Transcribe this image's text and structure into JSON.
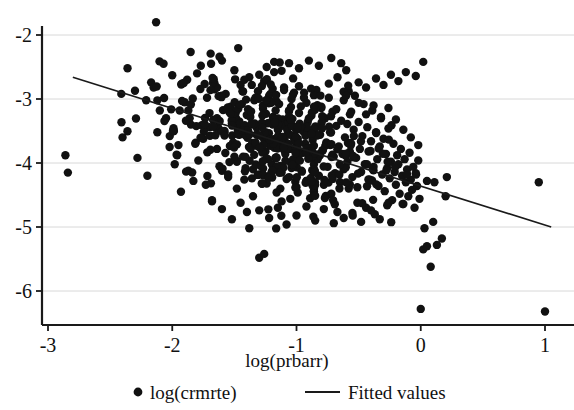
{
  "chart_data": {
    "type": "scatter",
    "title": "",
    "subtitle": "",
    "xlabel": "log(prbarr)",
    "ylabel": "",
    "xlim": [
      -3.15,
      1.15
    ],
    "ylim": [
      -6.55,
      -1.62
    ],
    "xticks": [
      -3,
      -2,
      -1,
      0,
      1
    ],
    "xtick_labels": [
      "-3",
      "-2",
      "-1",
      "0",
      "1"
    ],
    "yticks": [
      -2,
      -3,
      -4,
      -5,
      -6
    ],
    "ytick_labels": [
      "-2",
      "-3",
      "-4",
      "-5",
      "-6"
    ],
    "grid": "horizontal",
    "legend_position": "bottom",
    "legend": [
      {
        "key": "scatter",
        "marker": "circle",
        "label": "log(crmrte)"
      },
      {
        "key": "fit",
        "marker": "line",
        "label": "Fitted values"
      }
    ],
    "series": [
      {
        "name": "log(crmrte)",
        "type": "scatter",
        "marker": "filled-circle",
        "color": "#111111",
        "marker_size": 5.2,
        "n_points": 286,
        "points": [
          [
            -2.13,
            -1.8
          ],
          [
            -2.86,
            -3.88
          ],
          [
            -2.84,
            -4.15
          ],
          [
            -2.41,
            -2.92
          ],
          [
            -2.36,
            -2.52
          ],
          [
            -2.3,
            -2.87
          ],
          [
            -2.21,
            -3.02
          ],
          [
            -2.17,
            -2.74
          ],
          [
            -2.15,
            -2.82
          ],
          [
            -2.1,
            -3.18
          ],
          [
            -2.07,
            -2.45
          ],
          [
            -2.05,
            -3.3
          ],
          [
            -2.02,
            -3.58
          ],
          [
            -2.0,
            -2.63
          ],
          [
            -1.98,
            -4.02
          ],
          [
            -1.96,
            -3.88
          ],
          [
            -1.95,
            -3.72
          ],
          [
            -1.93,
            -4.45
          ],
          [
            -1.9,
            -3.05
          ],
          [
            -1.88,
            -2.7
          ],
          [
            -1.87,
            -4.12
          ],
          [
            -1.85,
            -3.4
          ],
          [
            -1.83,
            -4.28
          ],
          [
            -1.8,
            -2.6
          ],
          [
            -1.79,
            -3.96
          ],
          [
            -1.77,
            -2.48
          ],
          [
            -1.75,
            -3.62
          ],
          [
            -1.73,
            -4.34
          ],
          [
            -1.72,
            -2.98
          ],
          [
            -1.7,
            -3.22
          ],
          [
            -1.68,
            -4.6
          ],
          [
            -1.66,
            -2.85
          ],
          [
            -1.64,
            -3.78
          ],
          [
            -1.62,
            -4.05
          ],
          [
            -1.6,
            -2.4
          ],
          [
            -1.58,
            -3.52
          ],
          [
            -1.57,
            -2.92
          ],
          [
            -1.55,
            -4.22
          ],
          [
            -1.53,
            -3.12
          ],
          [
            -1.51,
            -3.68
          ],
          [
            -1.5,
            -2.55
          ],
          [
            -1.48,
            -4.4
          ],
          [
            -1.46,
            -3.35
          ],
          [
            -1.45,
            -2.78
          ],
          [
            -1.43,
            -3.9
          ],
          [
            -1.41,
            -4.08
          ],
          [
            -1.4,
            -3.25
          ],
          [
            -1.38,
            -2.66
          ],
          [
            -1.37,
            -3.74
          ],
          [
            -1.35,
            -4.52
          ],
          [
            -1.34,
            -3.02
          ],
          [
            -1.32,
            -3.45
          ],
          [
            -1.31,
            -2.88
          ],
          [
            -1.3,
            -4.18
          ],
          [
            -1.28,
            -3.58
          ],
          [
            -1.27,
            -3.15
          ],
          [
            -1.26,
            -2.72
          ],
          [
            -1.25,
            -3.82
          ],
          [
            -1.24,
            -4.32
          ],
          [
            -1.23,
            -3.38
          ],
          [
            -1.22,
            -2.95
          ],
          [
            -1.21,
            -3.66
          ],
          [
            -1.2,
            -4.02
          ],
          [
            -1.19,
            -3.28
          ],
          [
            -1.18,
            -2.58
          ],
          [
            -1.17,
            -3.92
          ],
          [
            -1.16,
            -4.46
          ],
          [
            -1.15,
            -3.48
          ],
          [
            -1.14,
            -3.08
          ],
          [
            -1.13,
            -3.72
          ],
          [
            -1.12,
            -4.15
          ],
          [
            -1.11,
            -3.32
          ],
          [
            -1.1,
            -2.82
          ],
          [
            -1.09,
            -3.86
          ],
          [
            -1.08,
            -4.25
          ],
          [
            -1.07,
            -3.55
          ],
          [
            -1.06,
            -3.18
          ],
          [
            -1.05,
            -3.78
          ],
          [
            -1.04,
            -4.08
          ],
          [
            -1.03,
            -3.42
          ],
          [
            -1.02,
            -2.9
          ],
          [
            -1.01,
            -3.96
          ],
          [
            -1.0,
            -4.38
          ],
          [
            -0.99,
            -3.62
          ],
          [
            -0.98,
            -3.22
          ],
          [
            -0.97,
            -3.84
          ],
          [
            -0.96,
            -4.12
          ],
          [
            -0.95,
            -3.5
          ],
          [
            -0.94,
            -2.98
          ],
          [
            -0.93,
            -3.7
          ],
          [
            -0.92,
            -4.28
          ],
          [
            -0.91,
            -3.36
          ],
          [
            -0.9,
            -3.88
          ],
          [
            -0.89,
            -4.55
          ],
          [
            -0.88,
            -3.26
          ],
          [
            -0.87,
            -3.64
          ],
          [
            -0.86,
            -4.02
          ],
          [
            -0.85,
            -3.44
          ],
          [
            -0.84,
            -2.86
          ],
          [
            -0.83,
            -3.94
          ],
          [
            -0.82,
            -4.2
          ],
          [
            -0.81,
            -3.56
          ],
          [
            -0.8,
            -3.14
          ],
          [
            -0.79,
            -3.8
          ],
          [
            -0.78,
            -4.34
          ],
          [
            -0.77,
            -3.3
          ],
          [
            -0.76,
            -3.68
          ],
          [
            -0.75,
            -4.06
          ],
          [
            -0.74,
            -2.76
          ],
          [
            -0.73,
            -3.52
          ],
          [
            -0.72,
            -4.48
          ],
          [
            -0.71,
            -3.2
          ],
          [
            -0.7,
            -3.9
          ],
          [
            -0.69,
            -4.16
          ],
          [
            -0.68,
            -3.42
          ],
          [
            -0.67,
            -2.66
          ],
          [
            -0.66,
            -3.74
          ],
          [
            -0.65,
            -4.3
          ],
          [
            -0.64,
            -3.34
          ],
          [
            -0.63,
            -3.86
          ],
          [
            -0.62,
            -4.1
          ],
          [
            -0.61,
            -3.6
          ],
          [
            -0.6,
            -2.55
          ],
          [
            -0.59,
            -3.98
          ],
          [
            -0.58,
            -4.4
          ],
          [
            -0.57,
            -3.24
          ],
          [
            -0.56,
            -3.7
          ],
          [
            -0.55,
            -4.22
          ],
          [
            -0.54,
            -3.48
          ],
          [
            -0.53,
            -2.95
          ],
          [
            -0.52,
            -3.92
          ],
          [
            -0.51,
            -4.62
          ],
          [
            -0.5,
            -3.36
          ],
          [
            -0.49,
            -3.78
          ],
          [
            -0.48,
            -4.14
          ],
          [
            -0.47,
            -3.58
          ],
          [
            -0.46,
            -3.08
          ],
          [
            -0.45,
            -4.02
          ],
          [
            -0.44,
            -4.7
          ],
          [
            -0.43,
            -3.44
          ],
          [
            -0.42,
            -3.82
          ],
          [
            -0.41,
            -4.26
          ],
          [
            -0.4,
            -3.66
          ],
          [
            -0.39,
            -3.18
          ],
          [
            -0.38,
            -4.06
          ],
          [
            -0.37,
            -4.8
          ],
          [
            -0.36,
            -3.52
          ],
          [
            -0.35,
            -3.94
          ],
          [
            -0.34,
            -4.36
          ],
          [
            -0.33,
            -3.74
          ],
          [
            -0.32,
            -3.3
          ],
          [
            -0.31,
            -4.18
          ],
          [
            -0.3,
            -3.62
          ],
          [
            -0.29,
            -4.44
          ],
          [
            -0.28,
            -3.86
          ],
          [
            -0.27,
            -4.08
          ],
          [
            -0.26,
            -3.46
          ],
          [
            -0.25,
            -4.24
          ],
          [
            -0.24,
            -3.98
          ],
          [
            -0.23,
            -4.58
          ],
          [
            -0.22,
            -3.7
          ],
          [
            -0.21,
            -4.14
          ],
          [
            -0.2,
            -4.34
          ],
          [
            -0.19,
            -3.88
          ],
          [
            -0.18,
            -4.02
          ],
          [
            -0.17,
            -4.48
          ],
          [
            -0.16,
            -3.78
          ],
          [
            -0.15,
            -4.2
          ],
          [
            -0.14,
            -4.64
          ],
          [
            -0.13,
            -3.94
          ],
          [
            -0.12,
            -4.3
          ],
          [
            -0.11,
            -4.1
          ],
          [
            -0.1,
            -4.52
          ],
          [
            -0.09,
            -3.84
          ],
          [
            -0.08,
            -4.26
          ],
          [
            -0.07,
            -4.42
          ],
          [
            -0.06,
            -4.06
          ],
          [
            -0.05,
            -4.7
          ],
          [
            -0.04,
            -4.16
          ],
          [
            -0.03,
            -4.36
          ],
          [
            -0.02,
            -3.96
          ],
          [
            -0.01,
            -4.56
          ],
          [
            0.0,
            -6.28
          ],
          [
            0.02,
            -5.35
          ],
          [
            0.03,
            -5.02
          ],
          [
            0.05,
            -5.3
          ],
          [
            0.08,
            -5.62
          ],
          [
            0.1,
            -4.92
          ],
          [
            0.13,
            -5.28
          ],
          [
            0.17,
            -5.18
          ],
          [
            0.2,
            -4.52
          ],
          [
            0.21,
            -4.22
          ],
          [
            0.05,
            -4.28
          ],
          [
            0.11,
            -4.3
          ],
          [
            1.0,
            -6.32
          ],
          [
            0.95,
            -4.3
          ],
          [
            -0.62,
            -4.86
          ],
          [
            -0.55,
            -4.78
          ],
          [
            -0.48,
            -4.92
          ],
          [
            -0.4,
            -4.74
          ],
          [
            -0.33,
            -4.88
          ],
          [
            -0.27,
            -4.66
          ],
          [
            -0.7,
            -4.94
          ],
          [
            -0.78,
            -4.72
          ],
          [
            -0.85,
            -4.9
          ],
          [
            -0.92,
            -4.68
          ],
          [
            -1.0,
            -4.82
          ],
          [
            -1.08,
            -4.96
          ],
          [
            -1.15,
            -4.7
          ],
          [
            -1.22,
            -4.86
          ],
          [
            -1.3,
            -4.74
          ],
          [
            -1.38,
            -5.02
          ],
          [
            -1.45,
            -4.62
          ],
          [
            -1.52,
            -4.88
          ],
          [
            -1.6,
            -4.72
          ],
          [
            -1.68,
            -4.58
          ],
          [
            -1.3,
            -5.48
          ],
          [
            -1.26,
            -5.42
          ],
          [
            -1.12,
            -4.6
          ],
          [
            -1.05,
            -4.56
          ],
          [
            -2.4,
            -3.6
          ],
          [
            -2.28,
            -3.92
          ],
          [
            -2.2,
            -4.2
          ],
          [
            -2.12,
            -3.52
          ],
          [
            -1.6,
            -4.12
          ],
          [
            -1.55,
            -4.18
          ],
          [
            -1.48,
            -3.98
          ],
          [
            -1.42,
            -4.26
          ],
          [
            -1.35,
            -4.1
          ],
          [
            -1.28,
            -4.32
          ],
          [
            -1.2,
            -4.14
          ],
          [
            -1.13,
            -4.4
          ],
          [
            -1.06,
            -4.22
          ],
          [
            -0.99,
            -4.46
          ],
          [
            -0.92,
            -4.28
          ],
          [
            -0.86,
            -4.5
          ],
          [
            -1.5,
            -3.2
          ],
          [
            -1.44,
            -3.08
          ],
          [
            -1.39,
            -3.16
          ],
          [
            -1.33,
            -2.98
          ],
          [
            -1.27,
            -3.1
          ],
          [
            -1.21,
            -2.92
          ],
          [
            -1.16,
            -3.04
          ],
          [
            -1.1,
            -2.86
          ],
          [
            -1.04,
            -3.0
          ],
          [
            -0.98,
            -2.8
          ],
          [
            -1.7,
            -3.44
          ],
          [
            -1.64,
            -3.3
          ],
          [
            -1.58,
            -3.5
          ],
          [
            -1.52,
            -3.38
          ],
          [
            -1.46,
            -3.56
          ],
          [
            -1.4,
            -3.46
          ],
          [
            -0.92,
            -3.06
          ],
          [
            -0.86,
            -2.94
          ],
          [
            -0.8,
            -3.12
          ],
          [
            -0.74,
            -2.98
          ],
          [
            -0.68,
            -3.16
          ],
          [
            -0.62,
            -3.02
          ],
          [
            -0.56,
            -3.2
          ],
          [
            -0.5,
            -3.06
          ],
          [
            -0.44,
            -3.24
          ],
          [
            -0.38,
            -3.1
          ],
          [
            -0.32,
            -3.28
          ],
          [
            -0.26,
            -3.14
          ],
          [
            -0.2,
            -3.32
          ],
          [
            -0.14,
            -3.48
          ],
          [
            -0.08,
            -3.6
          ],
          [
            -0.02,
            -3.72
          ],
          [
            -0.58,
            -2.88
          ],
          [
            -0.5,
            -2.74
          ],
          [
            -0.44,
            -2.82
          ],
          [
            -0.36,
            -2.68
          ],
          [
            -0.3,
            -2.78
          ],
          [
            -0.24,
            -2.62
          ],
          [
            -0.18,
            -2.72
          ],
          [
            -0.12,
            -2.58
          ],
          [
            -1.3,
            -2.62
          ],
          [
            -1.24,
            -2.5
          ],
          [
            -1.18,
            -2.42
          ],
          [
            -1.12,
            -2.56
          ],
          [
            -1.06,
            -2.44
          ],
          [
            -0.98,
            -2.52
          ],
          [
            -0.9,
            -2.4
          ],
          [
            -0.82,
            -2.48
          ],
          [
            -0.72,
            -2.36
          ],
          [
            -0.64,
            -2.44
          ],
          [
            -1.42,
            -2.7
          ],
          [
            -1.36,
            -2.78
          ],
          [
            -0.04,
            -2.64
          ],
          [
            0.02,
            -2.42
          ],
          [
            -1.94,
            -3.18
          ],
          [
            -1.86,
            -3.3
          ]
        ]
      },
      {
        "name": "Fitted values",
        "type": "line",
        "color": "#1a1a1a",
        "endpoints": [
          [
            -2.8,
            -2.66
          ],
          [
            1.05,
            -5.0
          ]
        ],
        "slope": -0.608,
        "intercept": -4.36
      }
    ]
  },
  "axis": {
    "x_title": "log(prbarr)"
  },
  "legend": {
    "scatter_label": "log(crmrte)",
    "fit_label": "Fitted values"
  }
}
